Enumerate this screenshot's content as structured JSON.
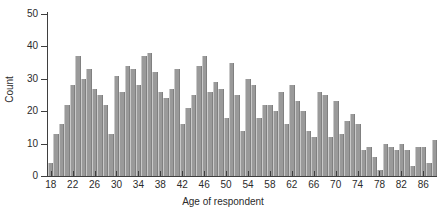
{
  "chart_data": {
    "type": "bar",
    "title": "",
    "xlabel": "Age of respondent",
    "ylabel": "Count",
    "xlim": [
      17.5,
      88.5
    ],
    "ylim": [
      0,
      50
    ],
    "grid": false,
    "legend": null,
    "bar_color": "#9a9a9a",
    "axis_color": "#3f3f3f",
    "bin_width": 1,
    "x_tick_labels": [
      "18",
      "22",
      "26",
      "30",
      "34",
      "38",
      "42",
      "46",
      "50",
      "54",
      "58",
      "62",
      "66",
      "70",
      "74",
      "78",
      "82",
      "86"
    ],
    "x_tick_values": [
      18,
      22,
      26,
      30,
      34,
      38,
      42,
      46,
      50,
      54,
      58,
      62,
      66,
      70,
      74,
      78,
      82,
      86
    ],
    "y_tick_labels": [
      "0",
      "10",
      "20",
      "30",
      "40",
      "50"
    ],
    "y_tick_values": [
      0,
      10,
      20,
      30,
      40,
      50
    ],
    "categories": [
      18,
      19,
      20,
      21,
      22,
      23,
      24,
      25,
      26,
      27,
      28,
      29,
      30,
      31,
      32,
      33,
      34,
      35,
      36,
      37,
      38,
      39,
      40,
      41,
      42,
      43,
      44,
      45,
      46,
      47,
      48,
      49,
      50,
      51,
      52,
      53,
      54,
      55,
      56,
      57,
      58,
      59,
      60,
      61,
      62,
      63,
      64,
      65,
      66,
      67,
      68,
      69,
      70,
      71,
      72,
      73,
      74,
      75,
      76,
      77,
      78,
      79,
      80,
      81,
      82,
      83,
      84,
      85,
      86,
      87,
      88
    ],
    "values": [
      4,
      13,
      16,
      22,
      28,
      37,
      30,
      33,
      27,
      25,
      22,
      13,
      31,
      26,
      34,
      33,
      28,
      37,
      38,
      32,
      26,
      24,
      27,
      33,
      16,
      21,
      25,
      34,
      37,
      26,
      29,
      27,
      18,
      35,
      25,
      14,
      30,
      28,
      18,
      22,
      22,
      20,
      26,
      16,
      28,
      23,
      20,
      14,
      12,
      26,
      25,
      12,
      23,
      13,
      17,
      19,
      16,
      8,
      9,
      6,
      2,
      10,
      9,
      8,
      10,
      8,
      3,
      9,
      9,
      4,
      11
    ]
  }
}
